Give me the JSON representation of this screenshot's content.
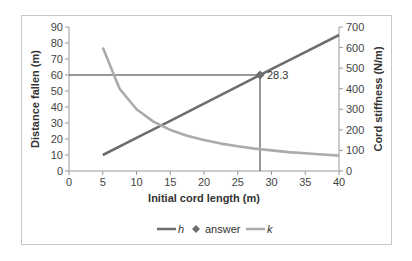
{
  "chart_data": {
    "type": "line",
    "title": "",
    "xlabel": "Initial cord length (m)",
    "ylabel": "Distance fallen (m)",
    "y2label": "Cord stiffness (N/m)",
    "xlim": [
      0,
      40
    ],
    "ylim": [
      0,
      90
    ],
    "y2lim": [
      0,
      700
    ],
    "x_ticks": [
      0,
      5,
      10,
      15,
      20,
      25,
      30,
      35,
      40
    ],
    "y_ticks": [
      0,
      10,
      20,
      30,
      40,
      50,
      60,
      70,
      80,
      90
    ],
    "y2_ticks": [
      0,
      100,
      200,
      300,
      400,
      500,
      600,
      700
    ],
    "grid": false,
    "legend_position": "bottom",
    "series": [
      {
        "name": "h",
        "axis": "left",
        "color": "#6e6e6e",
        "x": [
          5,
          10,
          15,
          20,
          25,
          30,
          35,
          40
        ],
        "values": [
          10,
          20.7,
          31.4,
          42.1,
          52.9,
          63.6,
          74.3,
          85
        ]
      },
      {
        "name": "answer",
        "axis": "left",
        "marker": "diamond",
        "color": "#6e6e6e",
        "x": [
          28.3
        ],
        "values": [
          60
        ],
        "label": "28.3"
      },
      {
        "name": "k",
        "axis": "right",
        "color": "#ababab",
        "x": [
          5,
          7.5,
          10,
          12.5,
          15,
          17.5,
          20,
          22.5,
          25,
          27.5,
          30,
          32.5,
          35,
          37.5,
          40
        ],
        "values": [
          600,
          400,
          300,
          240,
          200,
          171,
          150,
          133,
          120,
          109,
          100,
          92,
          86,
          80,
          75
        ]
      }
    ],
    "annotations": [
      {
        "type": "hline",
        "y": 60,
        "from_x": 0,
        "to_x": 28.3
      },
      {
        "type": "vline",
        "x": 28.3,
        "from_y": 0,
        "to_y": 60
      },
      {
        "type": "text",
        "text": "28.3",
        "x": 28.3,
        "y": 60
      }
    ]
  },
  "labels": {
    "xlabel": "Initial cord length (m)",
    "ylabel": "Distance fallen (m)",
    "y2label": "Cord stiffness (N/m)",
    "answer_label": "28.3",
    "legend": [
      "h",
      "answer",
      "k"
    ]
  }
}
